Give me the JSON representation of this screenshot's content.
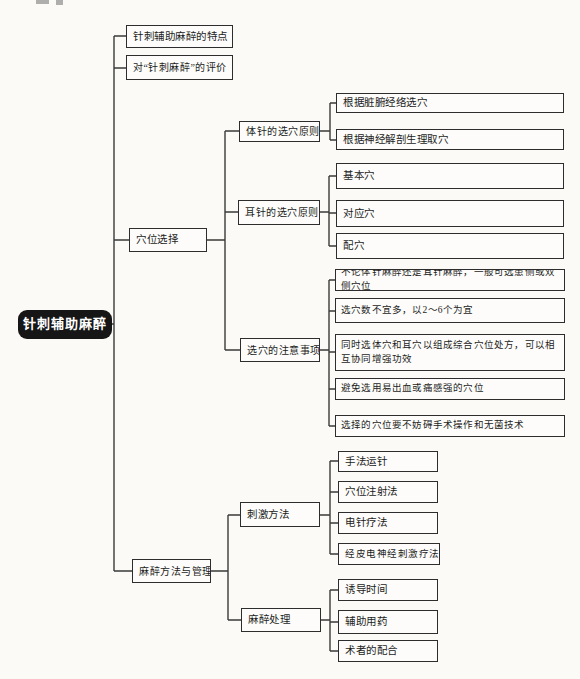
{
  "colors": {
    "page_bg": "#fbfaf7",
    "box_border": "#2d2d2d",
    "line_color": "#3a3a3a",
    "root_bg": "#161616",
    "root_text": "#ffffff"
  },
  "diagram": {
    "root": {
      "label": "针刺辅助麻醉"
    },
    "branches": [
      {
        "label": "针刺辅助麻醉的特点",
        "children": []
      },
      {
        "label": "对“针刺麻醉”的评价",
        "children": []
      },
      {
        "label": "穴位选择",
        "children": [
          {
            "label": "体针的选穴原则",
            "children": [
              {
                "label": "根据脏腑经络选穴"
              },
              {
                "label": "根据神经解剖生理取穴"
              }
            ]
          },
          {
            "label": "耳针的选穴原则",
            "children": [
              {
                "label": "基本穴"
              },
              {
                "label": "对应穴"
              },
              {
                "label": "配穴"
              }
            ]
          },
          {
            "label": "选穴的注意事项",
            "children": [
              {
                "label": "不论体针麻醉还是耳针麻醉，一般可选患侧或双侧穴位"
              },
              {
                "label": "选穴数不宜多，以2～6个为宜"
              },
              {
                "label": "同时选体穴和耳穴以组成综合穴位处方，可以相互协同增强功效"
              },
              {
                "label": "避免选用易出血或痛感强的穴位"
              },
              {
                "label": "选择的穴位要不妨碍手术操作和无菌技术"
              }
            ]
          }
        ]
      },
      {
        "label": "麻醉方法与管理",
        "children": [
          {
            "label": "刺激方法",
            "children": [
              {
                "label": "手法运针"
              },
              {
                "label": "穴位注射法"
              },
              {
                "label": "电针疗法"
              },
              {
                "label": "经皮电神经刺激疗法"
              }
            ]
          },
          {
            "label": "麻醉处理",
            "children": [
              {
                "label": "诱导时间"
              },
              {
                "label": "辅助用药"
              },
              {
                "label": "术者的配合"
              }
            ]
          }
        ]
      }
    ]
  }
}
